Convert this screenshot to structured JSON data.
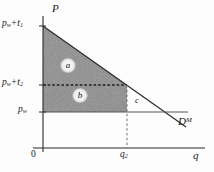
{
  "figure": {
    "type": "economics-diagram",
    "axes": {
      "vertical_label": "P",
      "horizontal_label": "q",
      "origin_label": "0"
    },
    "price_ticks": [
      {
        "id": "p1",
        "text_main": "p",
        "text_sub": "w",
        "text_tail": "+t",
        "tail_sub": "1"
      },
      {
        "id": "p2",
        "text_main": "p",
        "text_sub": "w",
        "text_tail": "+t",
        "tail_sub": "2"
      },
      {
        "id": "pw",
        "text_main": "p",
        "text_sub": "w",
        "text_tail": "",
        "tail_sub": ""
      }
    ],
    "quantity_ticks": [
      {
        "id": "q2",
        "text_main": "q",
        "text_sub": "2"
      }
    ],
    "curves": [
      {
        "id": "demand",
        "label_main": "D",
        "label_sup": "M"
      }
    ],
    "regions": [
      {
        "id": "a",
        "label": "a"
      },
      {
        "id": "b",
        "label": "b"
      },
      {
        "id": "c",
        "label": "c"
      }
    ],
    "colors": {
      "line": "#2b2b2b",
      "shade_upper": "#8d8d8d",
      "shade_lower": "#8a8a8a",
      "background": "#fdfdfd",
      "text": "#1a1a1a"
    }
  }
}
